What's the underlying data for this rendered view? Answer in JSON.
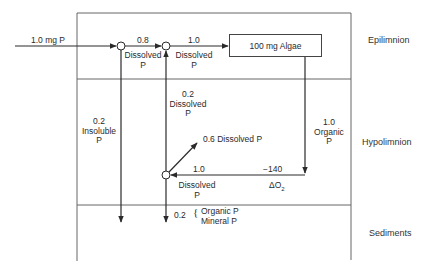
{
  "zones": {
    "epilimnion": "Epilimnion",
    "hypolimnion": "Hypolimnion",
    "sediments": "Sediments"
  },
  "inputs": {
    "external_load": "1.0 mg P"
  },
  "algae_box": {
    "label": "100 mg Algae"
  },
  "flows": {
    "to_node2": {
      "value": "0.8",
      "line1": "Dissolved",
      "line2": "P"
    },
    "to_algae": {
      "value": "1.0",
      "line1": "Dissolved",
      "line2": "P"
    },
    "upward": {
      "value": "0.2",
      "line1": "Dissolved",
      "line2": "P"
    },
    "insoluble": {
      "value": "0.2",
      "line1": "Insoluble",
      "line2": "P"
    },
    "organic_settling": {
      "value": "1.0",
      "line1": "Organic",
      "line2": "P"
    },
    "recycle": {
      "value": "0.6 Dissolved P"
    },
    "regeneration": {
      "value": "1.0",
      "line1": "Dissolved",
      "line2": "P"
    },
    "oxygen": {
      "value": "−140",
      "symbol": "ΔO",
      "subscript": "2"
    },
    "sediment_burial": {
      "value": "0.2",
      "line1": "Organic P",
      "line2": "Mineral P"
    }
  },
  "colors": {
    "line": "#2a2a2a",
    "frame": "#555555",
    "background": "#ffffff"
  }
}
